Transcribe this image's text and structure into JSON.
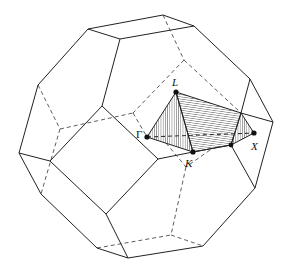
{
  "figure": {
    "colors": {
      "line": "#222222",
      "hatch": "#444444",
      "background": "#ffffff"
    },
    "points": [
      {
        "label": "L",
        "x": 176,
        "y": 92,
        "lx": 172,
        "ly": 86
      },
      {
        "label": "Γ",
        "x": 147,
        "y": 137,
        "lx": 136,
        "ly": 136
      },
      {
        "label": "K",
        "x": 193,
        "y": 152,
        "lx": 186,
        "ly": 166
      },
      {
        "label": "X",
        "x": 254,
        "y": 133,
        "lx": 252,
        "ly": 150
      },
      {
        "label": "",
        "x": 231,
        "y": 145
      }
    ],
    "labels": {
      "L": "L",
      "Gamma": "Γ",
      "K": "K",
      "X": "X"
    }
  }
}
